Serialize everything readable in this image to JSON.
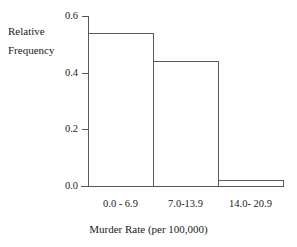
{
  "chart_data": {
    "type": "bar",
    "title": "",
    "subtitle": "",
    "xlabel": "Murder Rate (per 100,000)",
    "ylabel_line1": "Relative",
    "ylabel_line2": "Frequency",
    "ylabel": "Relative Frequency",
    "categories": [
      "0.0 - 6.9",
      "7.0-13.9",
      "14.0- 20.9"
    ],
    "values": [
      0.54,
      0.44,
      0.02
    ],
    "ylim": [
      0.0,
      0.6
    ],
    "yticks": [
      "0.0",
      "0.2",
      "0.4",
      "0.6"
    ],
    "ytick_values": [
      0.0,
      0.2,
      0.4,
      0.6
    ],
    "grid": false,
    "legend": false,
    "legend_position": "none",
    "bar_fill_color": "#ffffff",
    "bar_edge_color": "#5a5a5a",
    "axis_color": "#555555",
    "text_color": "#1a1a1a",
    "background_color": "#ffffff",
    "bars_contiguous": true,
    "annotations": []
  }
}
